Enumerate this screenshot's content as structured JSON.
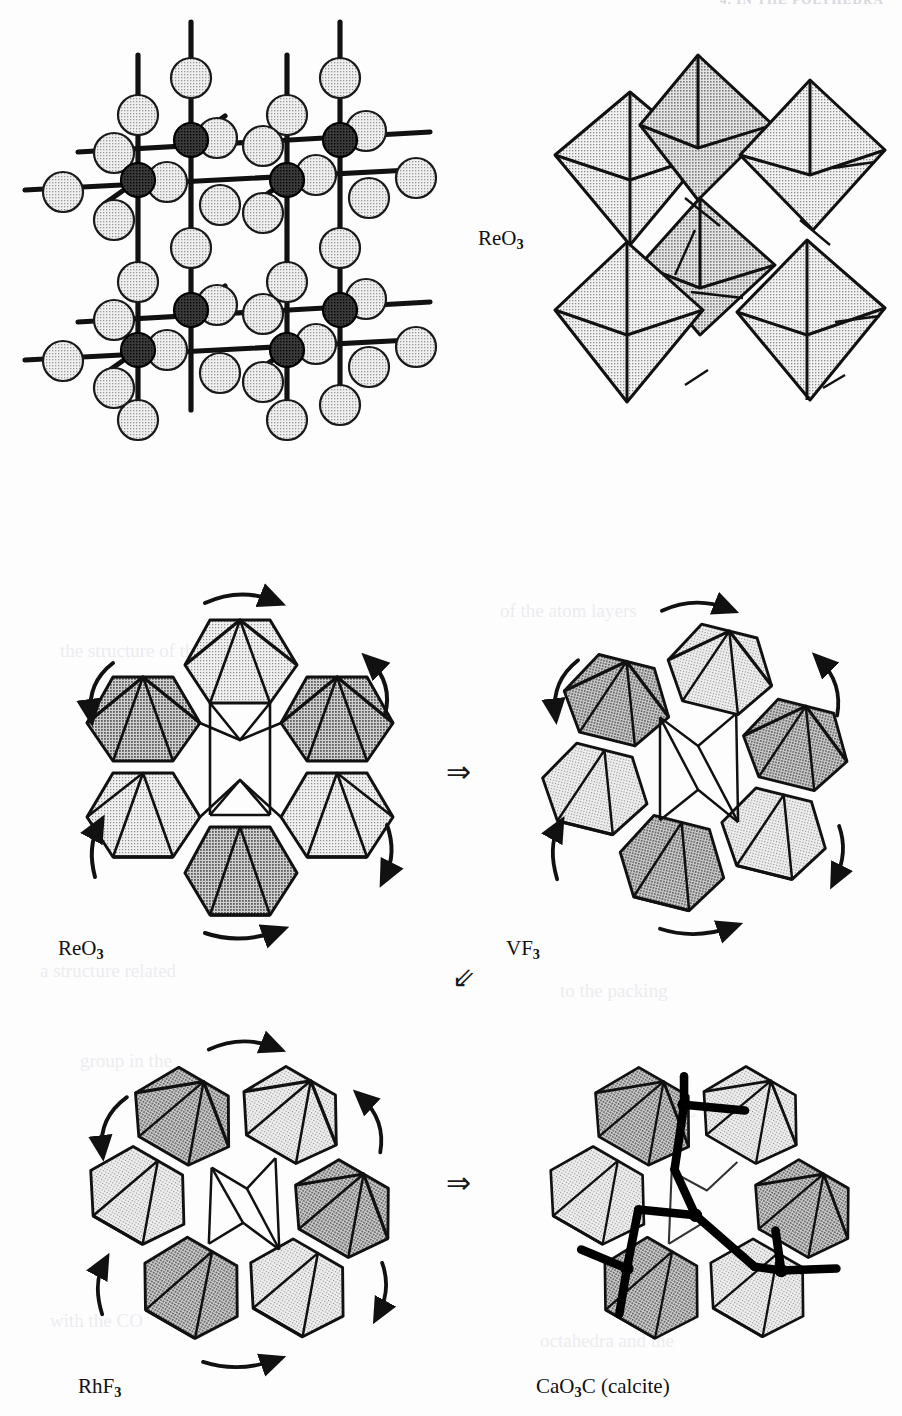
{
  "page": {
    "running_head": "4. IN THE POLYHEDRA",
    "width": 902,
    "height": 1416,
    "background": "#fdfdfd"
  },
  "colors": {
    "ink": "#111111",
    "octa_light": "#e2e2e2",
    "octa_dark": "#b9b9b9",
    "sphere_light": "#e8e8e8",
    "sphere_dark": "#2a2a2a",
    "ghost": "#ececf0"
  },
  "figure": {
    "title_internal": "Relationship of ReO3, VF3, RhF3 and calcite structures",
    "panels": [
      {
        "id": "reo3-ball-stick",
        "name": "ReO3 ball-and-stick lattice",
        "style": "ball-and-stick",
        "description": "Cubic corner-linked lattice: dark metal atoms at nodes, light oxygen spheres at bond midpoints",
        "label": "",
        "metal_atoms": 8,
        "oxygen_atoms": 30
      },
      {
        "id": "reo3-polyhedra",
        "name": "ReO3 corner-sharing octahedra",
        "style": "polyhedral",
        "description": "Array of corner-sharing octahedra in perspective view",
        "label": "ReO3",
        "label_text": "ReO",
        "label_sub": "3",
        "octahedra": 6
      },
      {
        "id": "reo3-ring",
        "name": "ReO3 hexagonal ring of octahedra",
        "style": "polyhedral-ring",
        "rotation_deg": 0,
        "label_text": "ReO",
        "label_sub": "3",
        "octahedra": 6,
        "rotation_arrows": 6
      },
      {
        "id": "vf3-ring",
        "name": "VF3 partially rotated ring of octahedra",
        "style": "polyhedral-ring",
        "rotation_deg": 14,
        "label_text": "VF",
        "label_sub": "3",
        "octahedra": 6,
        "rotation_arrows": 6
      },
      {
        "id": "rhf3-ring",
        "name": "RhF3 fully rotated ring of octahedra",
        "style": "polyhedral-ring",
        "rotation_deg": 28,
        "label_text": "RhF",
        "label_sub": "3",
        "octahedra": 6,
        "rotation_arrows": 6
      },
      {
        "id": "calcite-ring",
        "name": "Calcite ring with carbonate groups",
        "style": "polyhedral-ring-with-carbonate",
        "rotation_deg": 28,
        "label_text": "CaO",
        "label_sub": "3",
        "label_tail": "C (calcite)",
        "octahedra": 6,
        "carbonate_groups": 3
      }
    ],
    "labels": {
      "reo3_top": {
        "text": "ReO",
        "sub": "3"
      },
      "reo3_mid": {
        "text": "ReO",
        "sub": "3"
      },
      "vf3": {
        "text": "VF",
        "sub": "3"
      },
      "rhf3": {
        "text": "RhF",
        "sub": "3"
      },
      "calcite": {
        "text": "CaO",
        "sub": "3",
        "tail": "C (calcite)"
      }
    },
    "arrows": [
      {
        "id": "arrow-reo3-to-vf3",
        "glyph": "⇒",
        "direction": "right"
      },
      {
        "id": "arrow-vf3-to-rhf3",
        "glyph": "⇙",
        "direction": "down-left"
      },
      {
        "id": "arrow-rhf3-to-calcite",
        "glyph": "⇒",
        "direction": "right"
      }
    ]
  },
  "ghost_text": [
    "the structure of the  oxide",
    "of the  atom  layers",
    "a structure   related",
    "to the   packing",
    "group in  the",
    "calcium    O  C",
    "with  the  CO",
    "octahedra  and  the"
  ]
}
